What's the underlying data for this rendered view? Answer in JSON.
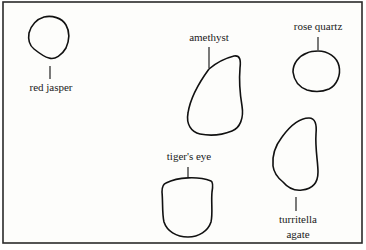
{
  "diagram": {
    "type": "labeled illustration",
    "frame": {
      "x": 3,
      "y": 2,
      "width": 359,
      "height": 241
    },
    "colors": {
      "background": "#ffffff",
      "paper": "#fdfdfb",
      "outline": "#111111",
      "text": "#1a1a1a"
    },
    "stones": [
      {
        "id": "red-jasper",
        "label_lines": [
          "red jasper"
        ],
        "label_position": "below",
        "shape": "irregular rounded blob"
      },
      {
        "id": "amethyst",
        "label_lines": [
          "amethyst"
        ],
        "label_position": "above",
        "shape": "teardrop / pear, pointed top-right"
      },
      {
        "id": "rose-quartz",
        "label_lines": [
          "rose quartz"
        ],
        "label_position": "above",
        "shape": "rounded oval"
      },
      {
        "id": "tigers-eye",
        "label_lines": [
          "tiger's eye"
        ],
        "label_position": "above",
        "shape": "shield / tumbled oblong with flat top"
      },
      {
        "id": "turritella-agate",
        "label_lines": [
          "turritella",
          "agate"
        ],
        "label_position": "below",
        "shape": "elongated teardrop, narrow top"
      }
    ]
  }
}
